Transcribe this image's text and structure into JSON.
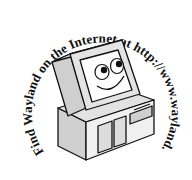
{
  "badge": {
    "arc_text": "Find Wayland on the Internet at http://www.wayland.co.uk",
    "ink_color": "#111111",
    "light_gray": "#e6e6e6",
    "mid_gray": "#bdbdbd",
    "dark_gray": "#8c8c8c",
    "background": "#ffffff"
  },
  "illustration": {
    "subject": "smiling-computer",
    "icon": "computer-icon"
  }
}
